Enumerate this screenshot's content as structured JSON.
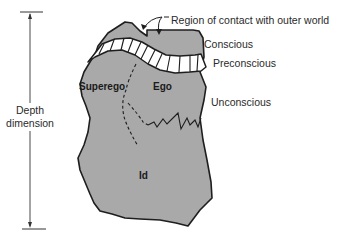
{
  "diagram": {
    "type": "structural model of the mind (iceberg-like)",
    "colors": {
      "fill": "#a9a9a9",
      "outline": "#1e1e1e",
      "band_fill": "#ffffff",
      "text": "#2a2a2a"
    },
    "axis": {
      "label_line1": "Depth",
      "label_line2": "dimension"
    },
    "annotations": {
      "contact": "Region of contact with outer world",
      "conscious": "Conscious",
      "preconscious": "Preconscious",
      "unconscious": "Unconscious"
    },
    "regions": {
      "superego": "Superego",
      "ego": "Ego",
      "id": "Id"
    }
  }
}
